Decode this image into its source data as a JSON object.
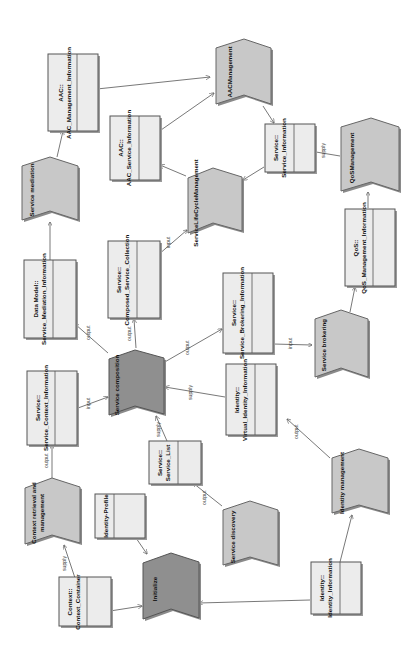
{
  "diagram": {
    "orientation": "rotated-90-ccw",
    "colors": {
      "class_fill": "#ececec",
      "activity_fill": "#c8c8c8",
      "activity_highlight_fill": "#8f8f8f",
      "stroke": "#555555"
    },
    "classes": [
      {
        "id": "aac_mgmt_info",
        "line1": "AAC::",
        "line2": "AAC_Management_Information"
      },
      {
        "id": "aac_svc_info",
        "line1": "AAC::",
        "line2": "AAC_Service_Information"
      },
      {
        "id": "svc_info",
        "line1": "Service::",
        "line2": "Service_Information"
      },
      {
        "id": "qos_mgmt_info",
        "line1": "QoS::",
        "line2": "QoS_Management_Information"
      },
      {
        "id": "dm_med_info",
        "line1": "Data Model::",
        "line2": "Service_Mediation_Information"
      },
      {
        "id": "composed_coll",
        "line1": "Service::",
        "line2": "Composed_Service_Collection"
      },
      {
        "id": "brokering_info",
        "line1": "Service::",
        "line2": "Service_Brokering_Information"
      },
      {
        "id": "context_info",
        "line1": "Service::",
        "line2": "Service_Context_Information"
      },
      {
        "id": "virtual_identity",
        "line1": "Identity::",
        "line2": "Virtual_Identity_Information"
      },
      {
        "id": "service_list",
        "line1": "Service::",
        "line2": "Service_List"
      },
      {
        "id": "identity_profile",
        "line1": "Identity-Profile",
        "line2": ""
      },
      {
        "id": "context_container",
        "line1": "Context::",
        "line2": "Context_Container"
      },
      {
        "id": "identity_info",
        "line1": "Identity::",
        "line2": "Identity_Information"
      }
    ],
    "activities": [
      {
        "id": "aac_mgmt",
        "label": "AACManagement"
      },
      {
        "id": "service_mediation",
        "label": "Service mediation"
      },
      {
        "id": "slc_mgmt",
        "label": "ServiceLifeCycleManagement"
      },
      {
        "id": "qos_mgmt",
        "label": "QoSManagement"
      },
      {
        "id": "service_composition",
        "label": "Service composition"
      },
      {
        "id": "service_brokering",
        "label": "Service brokering"
      },
      {
        "id": "context_retrieval",
        "label": "Context retrieval and management"
      },
      {
        "id": "initialize",
        "label": "Initialize"
      },
      {
        "id": "service_discovery",
        "label": "Service discovery"
      },
      {
        "id": "identity_mgmt",
        "label": "Identity management"
      }
    ],
    "edge_labels": {
      "supply": "supply",
      "input": "input",
      "output": "output"
    }
  }
}
